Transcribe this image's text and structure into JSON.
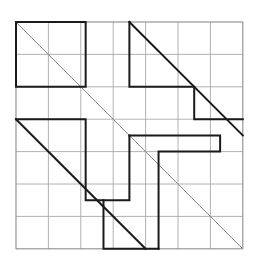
{
  "figure": {
    "type": "line-drawing",
    "canvas": {
      "width": 259,
      "height": 260,
      "background": "#ffffff"
    },
    "grid": {
      "origin_x": 16,
      "origin_y": 22,
      "columns": 7,
      "rows": 7,
      "cell_size": 32.4,
      "line_color": "#a9a9a9",
      "line_width": 0.9,
      "border_color": "#8c8c8c",
      "border_width": 1.1,
      "visible": true
    },
    "styles": {
      "bold_color": "#1a1a1a",
      "bold_width": 2.0,
      "thin_diagonal_color": "#8a8a8a",
      "thin_diagonal_width": 1.0
    },
    "thin_diagonals": [
      {
        "name": "main-diagonal",
        "points": "0,0 7,7"
      }
    ],
    "bold_diagonals": [
      {
        "name": "upper-right-diagonal",
        "points": "3.5,0 7,3.5"
      },
      {
        "name": "lower-left-diagonal",
        "points": "0,3 4,7"
      }
    ],
    "bold_paths": [
      {
        "name": "top-left-square",
        "points": "0,0 2.15,0 2.15,2 0,2 0,0"
      },
      {
        "name": "top-right-step",
        "points": "3.5,0 3.5,2 5.5,2 5.5,3 7,3"
      },
      {
        "name": "center-left-step",
        "points": "0,3 2.15,3 2.15,5.5 3.5,5.5 3.5,3.5"
      },
      {
        "name": "center-right-step",
        "points": "3.5,3.5 6.3,3.5 6.3,4 4.4,4 4.4,7"
      },
      {
        "name": "bottom-middle-step",
        "points": "4.4,7 2.7,7 2.7,5.5"
      }
    ]
  }
}
